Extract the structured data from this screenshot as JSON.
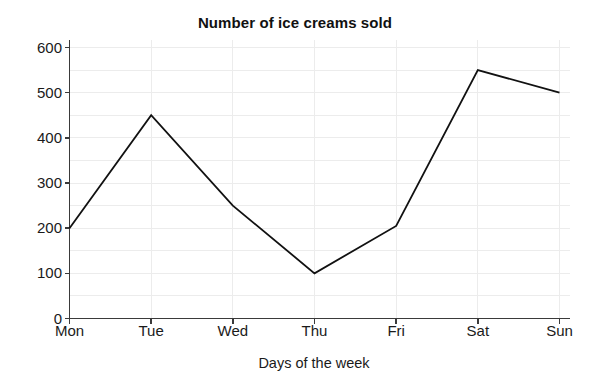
{
  "chart_data": {
    "type": "line",
    "title": "Number of ice creams sold",
    "xlabel": "Days of the week",
    "ylabel": "",
    "categories": [
      "Mon",
      "Tue",
      "Wed",
      "Thu",
      "Fri",
      "Sat",
      "Sun"
    ],
    "values": [
      200,
      450,
      250,
      100,
      205,
      550,
      500
    ],
    "series": [
      {
        "name": "Ice creams sold",
        "values": [
          200,
          450,
          250,
          100,
          205,
          550,
          500
        ]
      }
    ],
    "ylim": [
      0,
      600
    ],
    "yticks": [
      0,
      100,
      200,
      300,
      400,
      500,
      600
    ],
    "ytick_labels": [
      "0",
      "100",
      "200",
      "300",
      "400",
      "500",
      "600"
    ],
    "xtick_labels": [
      "Mon",
      "Tue",
      "Wed",
      "Thu",
      "Fri",
      "Sat",
      "Sun"
    ],
    "minor_y_step": 50,
    "grid": true,
    "grid_color": "#ececec",
    "legend": false,
    "legend_position": "none",
    "line_color": "#111111",
    "line_width": 1.8,
    "markers": false,
    "axis_color": "#3a3a3a",
    "background": "#ffffff"
  }
}
